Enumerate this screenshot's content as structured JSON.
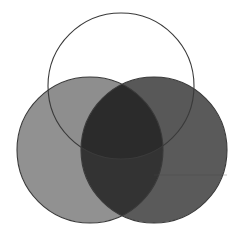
{
  "figure": {
    "background_color": "#ffffff",
    "width": 241,
    "height": 239
  },
  "chart_data": {
    "type": "venn",
    "title": "",
    "subtitle": "",
    "xlabel": "",
    "ylabel": "",
    "grid": false,
    "legend": "none",
    "set_count": 3,
    "blend_mode": "multiply",
    "sets": [
      {
        "id": "top",
        "label": "",
        "cx": 121,
        "cy": 86,
        "r": 73,
        "fill": "#ffffff",
        "fill_opacity": 0.0,
        "stroke": "#3a3a3a",
        "stroke_width": 1.1
      },
      {
        "id": "left",
        "label": "",
        "cx": 90,
        "cy": 150,
        "r": 73,
        "fill": "#919191",
        "fill_opacity": 1.0,
        "stroke": "#3a3a3a",
        "stroke_width": 1.1
      },
      {
        "id": "right",
        "label": "",
        "cx": 154,
        "cy": 150,
        "r": 73,
        "fill": "#5a5a5a",
        "fill_opacity": 1.0,
        "stroke": "#3a3a3a",
        "stroke_width": 1.1
      }
    ],
    "regions": [
      {
        "id": "top-only",
        "members": [
          "top"
        ],
        "color": "#ffffff"
      },
      {
        "id": "left-only",
        "members": [
          "left"
        ],
        "color": "#919191"
      },
      {
        "id": "right-only",
        "members": [
          "right"
        ],
        "color": "#5a5a5a"
      },
      {
        "id": "top-left",
        "members": [
          "top",
          "left"
        ],
        "color": "#8e8e8e"
      },
      {
        "id": "top-right",
        "members": [
          "top",
          "right"
        ],
        "color": "#585858"
      },
      {
        "id": "left-right",
        "members": [
          "left",
          "right"
        ],
        "color": "#333333"
      },
      {
        "id": "top-left-right",
        "members": [
          "top",
          "left",
          "right"
        ],
        "color": "#2b2b2b"
      }
    ],
    "annotations": [
      {
        "id": "faint-rule-right",
        "type": "line",
        "x1": 154,
        "y1": 175,
        "x2": 227,
        "y2": 175,
        "color": "#4a4a4a",
        "opacity": 0.45,
        "width": 0.7
      }
    ]
  }
}
